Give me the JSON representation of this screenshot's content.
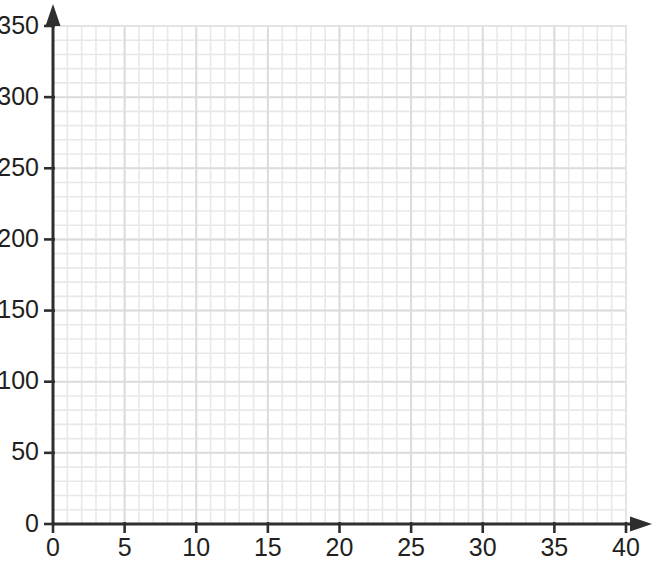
{
  "chart_data": {
    "type": "scatter",
    "title": "",
    "subtitle": "",
    "xlabel": "",
    "ylabel": "",
    "xlim": [
      0,
      40
    ],
    "ylim": [
      0,
      350
    ],
    "x_ticks": [
      0,
      5,
      10,
      15,
      20,
      25,
      30,
      35,
      40
    ],
    "y_ticks": [
      0,
      50,
      100,
      150,
      200,
      250,
      300,
      350
    ],
    "x_tick_labels": [
      "0",
      "5",
      "10",
      "15",
      "20",
      "25",
      "30",
      "35",
      "40"
    ],
    "y_tick_labels": [
      "0",
      "50",
      "100",
      "150",
      "200",
      "250",
      "300",
      "350"
    ],
    "x_minor_step": 1,
    "y_minor_step": 10,
    "grid": true,
    "grid_minor": true,
    "legend": null,
    "series": [],
    "x": [],
    "values": [],
    "annotations": [],
    "axis_arrows": true
  },
  "style": {
    "background_color": "#ffffff",
    "axis_color": "#2e2e2e",
    "tick_label_color": "#231f20",
    "grid_minor_color": "#e8e8e8",
    "grid_major_color": "#dcdcdc",
    "plot_area_border_color": "#e4e4e4"
  },
  "plot": {
    "origin_x_px": 53,
    "origin_y_px": 524,
    "x_unit_px": 14.325,
    "y_unit_px": 1.4229
  }
}
